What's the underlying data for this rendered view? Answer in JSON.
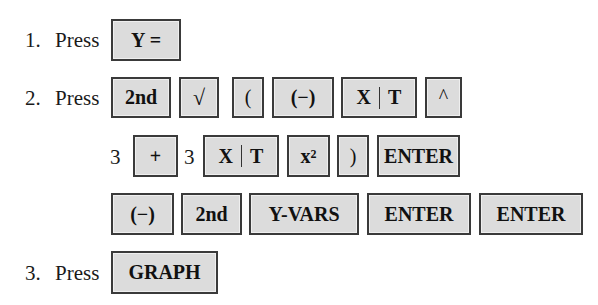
{
  "steps": [
    {
      "number": "1.",
      "verb": "Press",
      "keys": [
        "Y ="
      ]
    },
    {
      "number": "2.",
      "verb": "Press",
      "lines": [
        {
          "items": [
            "2nd",
            "√",
            "(",
            "(−)",
            "X|T",
            "^"
          ]
        },
        {
          "items": [
            "3",
            "+",
            "3",
            "X|T",
            "x²",
            ")",
            "ENTER"
          ]
        },
        {
          "items": [
            "(−)",
            "2nd",
            "Y-VARS",
            "ENTER",
            "ENTER"
          ]
        }
      ]
    },
    {
      "number": "3.",
      "verb": "Press",
      "keys": [
        "GRAPH"
      ]
    }
  ],
  "labels": {
    "s1_num": "1.",
    "s1_verb": "Press",
    "k_yeq": "Y =",
    "s2_num": "2.",
    "s2_verb": "Press",
    "k_2nd_a": "2nd",
    "k_sqrt": "√",
    "k_lparen": "(",
    "k_neg_a": "(−)",
    "k_x_a": "X",
    "k_t_a": "T",
    "k_caret": "^",
    "t_three_a": "3",
    "k_plus": "+",
    "t_three_b": "3",
    "k_x_b": "X",
    "k_t_b": "T",
    "k_xsq_base": "x",
    "k_xsq_exp": "2",
    "k_rparen": ")",
    "k_enter_a": "ENTER",
    "k_neg_b": "(−)",
    "k_2nd_b": "2nd",
    "k_yvars": "Y-VARS",
    "k_enter_b": "ENTER",
    "k_enter_c": "ENTER",
    "s3_num": "3.",
    "s3_verb": "Press",
    "k_graph": "GRAPH"
  },
  "colors": {
    "key_fill": "#dcdcdc",
    "key_border": "#3a3a3a",
    "text": "#1a1a1a"
  }
}
